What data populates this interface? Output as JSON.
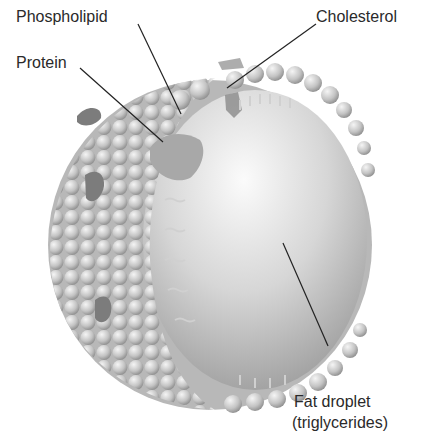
{
  "diagram": {
    "labels": {
      "phospholipid": "Phospholipid",
      "cholesterol": "Cholesterol",
      "protein": "Protein",
      "fat_droplet_line1": "Fat droplet",
      "fat_droplet_line2": "(triglycerides)"
    },
    "colors": {
      "background": "#ffffff",
      "text": "#2a2a2a",
      "leader_line": "#222222",
      "sphere_light": "#f4f4f4",
      "sphere_mid": "#c8c8c8",
      "sphere_dark": "#8a8a8a",
      "protein": "#9a9a9a"
    }
  }
}
